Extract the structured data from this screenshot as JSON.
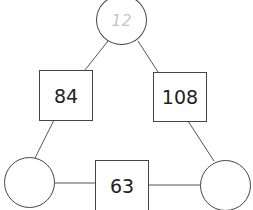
{
  "diagram": {
    "type": "arithmagon",
    "nodes": {
      "top_circle": "12",
      "bottom_left_circle": "",
      "bottom_right_circle": ""
    },
    "edges": {
      "left_box": "84",
      "right_box": "108",
      "bottom_box": "63"
    },
    "colors": {
      "stroke": "#444444",
      "hint_text": "#c8c8c8",
      "text": "#222222"
    }
  }
}
